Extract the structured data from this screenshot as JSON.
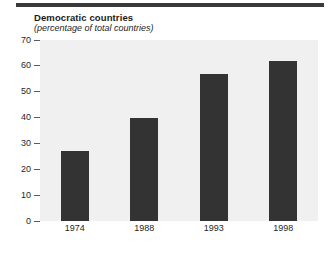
{
  "chart_data": {
    "type": "bar",
    "title": "Democratic countries",
    "subtitle": "(percentage of total countries)",
    "xlabel": "",
    "ylabel": "",
    "categories": [
      "1974",
      "1988",
      "1993",
      "1998"
    ],
    "values": [
      27,
      40,
      57,
      62
    ],
    "ylim": [
      0,
      70
    ],
    "yticks": [
      0,
      10,
      20,
      30,
      40,
      50,
      60,
      70
    ],
    "ytick_labels": [
      "0",
      "10",
      "20",
      "30",
      "40",
      "50",
      "60",
      "70"
    ],
    "grid": false,
    "legend": false,
    "series": [
      {
        "name": "Democratic countries",
        "values": [
          27,
          40,
          57,
          62
        ]
      }
    ],
    "colors": {
      "bar": "#333333",
      "panel_background": "#f0f0f0",
      "page_background": "#ffffff",
      "rule": "#3a3a3a",
      "text": "#1f1f1f"
    }
  }
}
